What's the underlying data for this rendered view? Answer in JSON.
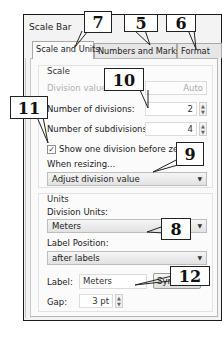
{
  "window": {
    "title": "Scale Bar"
  },
  "tabs": [
    {
      "label": "Scale and Units",
      "active": true
    },
    {
      "label": "Numbers and Marks",
      "active": false
    },
    {
      "label": "Format",
      "active": false
    }
  ],
  "scale": {
    "group_title": "Scale",
    "division_value": {
      "label": "Division value:",
      "value": "Auto",
      "disabled": true
    },
    "number_of_divisions": {
      "label": "Number of divisions:",
      "value": "2"
    },
    "number_of_subdivisions": {
      "label": "Number of subdivisions:",
      "value": "4"
    },
    "show_one_division": {
      "label": "Show one division before zero",
      "checked": true,
      "check_glyph": "✓"
    },
    "when_resizing": {
      "label": "When resizing...",
      "selected": "Adjust division value"
    }
  },
  "units": {
    "group_title": "Units",
    "division_units": {
      "label": "Division Units:",
      "selected": "Meters"
    },
    "label_position": {
      "label": "Label Position:",
      "selected": "after labels"
    },
    "label": {
      "label": "Label:",
      "value": "Meters"
    },
    "symbol_button": "Symbol...",
    "gap": {
      "label": "Gap:",
      "value": "3 pt"
    }
  },
  "icons": {
    "dropdown_arrow": "▼",
    "spin_up": "▲",
    "spin_down": "▼"
  },
  "callouts": [
    {
      "number": "7"
    },
    {
      "number": "5"
    },
    {
      "number": "6"
    },
    {
      "number": "10"
    },
    {
      "number": "11"
    },
    {
      "number": "9"
    },
    {
      "number": "8"
    },
    {
      "number": "12"
    }
  ]
}
